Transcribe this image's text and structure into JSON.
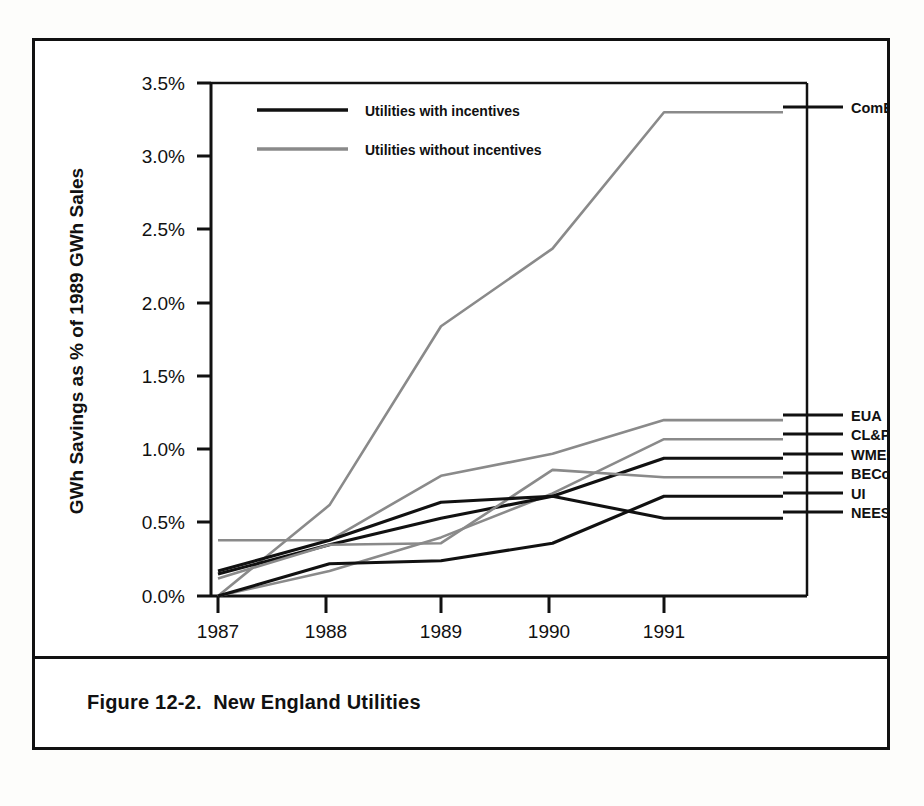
{
  "figure": {
    "caption": "Figure 12-2.  New England Utilities"
  },
  "chart_data": {
    "type": "line",
    "title": "",
    "xlabel": "Year",
    "ylabel": "GWh Savings as % of 1989 GWh Sales",
    "x": [
      1987,
      1988,
      1989,
      1990,
      1991
    ],
    "xticklabels": [
      "1987",
      "1988",
      "1989",
      "1990",
      "1991"
    ],
    "yticklabels": [
      "0.0%",
      "0.5%",
      "1.0%",
      "1.5%",
      "2.0%",
      "2.5%",
      "3.0%",
      "3.5%"
    ],
    "ytickvalues": [
      0.0,
      0.5,
      1.0,
      1.5,
      2.0,
      2.5,
      3.0,
      3.5
    ],
    "ylim": [
      0.0,
      3.5
    ],
    "xlim": [
      1986.6,
      1991.75
    ],
    "grid": false,
    "legend": {
      "position": "top-left-inside",
      "entries": [
        {
          "label": "Utilities with incentives",
          "style": "solid-black"
        },
        {
          "label": "Utilities without incentives",
          "style": "solid-gray"
        }
      ]
    },
    "series": [
      {
        "name": "ComElec",
        "group": "Utilities without incentives",
        "color": "#8a8a8a",
        "label_y_pct": 3.3,
        "values": [
          0.0,
          0.62,
          1.84,
          2.37,
          3.3
        ]
      },
      {
        "name": "EUA",
        "group": "Utilities without incentives",
        "color": "#8a8a8a",
        "label_y_pct": 1.2,
        "values": [
          0.38,
          0.38,
          0.82,
          0.97,
          1.2
        ]
      },
      {
        "name": "CL&P",
        "group": "Utilities without incentives",
        "color": "#8a8a8a",
        "label_y_pct": 1.07,
        "values": [
          0.0,
          0.17,
          0.4,
          0.7,
          1.07
        ]
      },
      {
        "name": "WMECo",
        "group": "Utilities with incentives",
        "color": "#111111",
        "label_y_pct": 0.94,
        "values": [
          0.15,
          0.35,
          0.53,
          0.68,
          0.94
        ]
      },
      {
        "name": "BECo",
        "group": "Utilities without incentives",
        "color": "#8a8a8a",
        "label_y_pct": 0.81,
        "values": [
          0.12,
          0.35,
          0.36,
          0.86,
          0.81
        ]
      },
      {
        "name": "UI",
        "group": "Utilities with incentives",
        "color": "#111111",
        "label_y_pct": 0.68,
        "values": [
          0.0,
          0.22,
          0.24,
          0.36,
          0.68
        ]
      },
      {
        "name": "NEES",
        "group": "Utilities with incentives",
        "color": "#111111",
        "label_y_pct": 0.53,
        "values": [
          0.17,
          0.38,
          0.64,
          0.68,
          0.53
        ]
      }
    ]
  }
}
